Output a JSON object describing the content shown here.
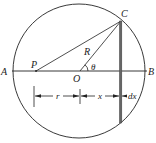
{
  "diagram": {
    "colors": {
      "stroke": "#222222",
      "strip": "#555555",
      "background": "#ffffff"
    },
    "points": {
      "A": "A",
      "B": "B",
      "C": "C",
      "O": "O",
      "P": "P"
    },
    "labels": {
      "radius": "R",
      "angle": "θ",
      "r": "r",
      "x": "x",
      "dx": "dx"
    }
  }
}
